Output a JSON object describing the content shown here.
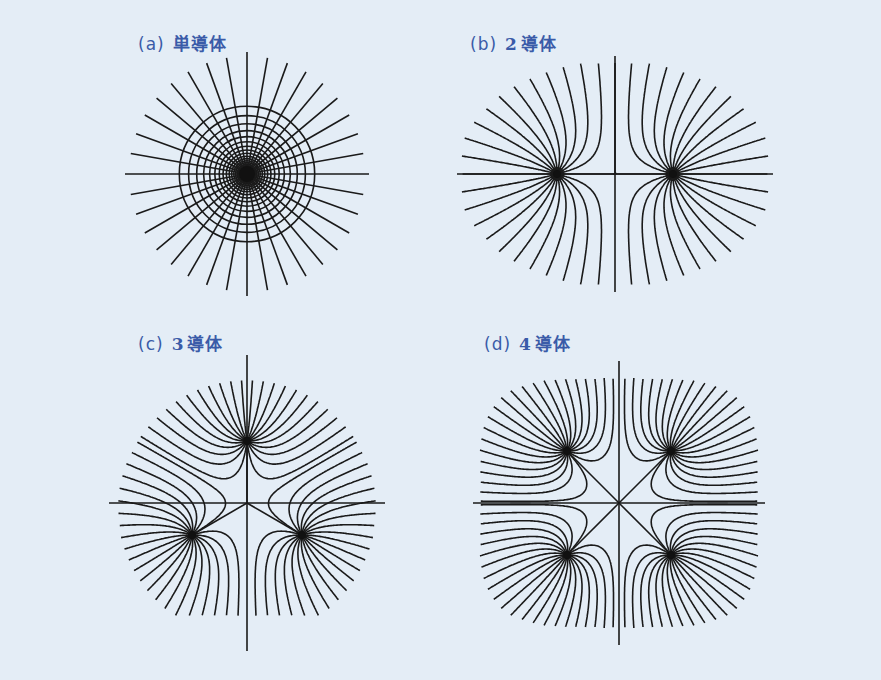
{
  "figure": {
    "background": "#e4edf6",
    "label_color": "#3a5ba8",
    "line_color": "#1a1a1a",
    "panels": [
      {
        "id": "a",
        "paren": "(a)",
        "number": "",
        "title": "単導体",
        "conductor_count": 1,
        "center": [
          247,
          174
        ],
        "label_pos": [
          138,
          30
        ],
        "description": "single conductor: concentric equipotential circles with radial field lines"
      },
      {
        "id": "b",
        "paren": "(b)",
        "number": "2",
        "title": "導体",
        "conductor_count": 2,
        "center": [
          615,
          174
        ],
        "label_pos": [
          470,
          30
        ],
        "description": "two conductors on horizontal axis"
      },
      {
        "id": "c",
        "paren": "(c)",
        "number": "3",
        "title": "導体",
        "conductor_count": 3,
        "center": [
          247,
          503
        ],
        "label_pos": [
          138,
          330
        ],
        "description": "three conductors in triangular arrangement"
      },
      {
        "id": "d",
        "paren": "(d)",
        "number": "4",
        "title": "導体",
        "conductor_count": 4,
        "center": [
          619,
          503
        ],
        "label_pos": [
          484,
          330
        ],
        "description": "four conductors in square arrangement"
      }
    ]
  }
}
